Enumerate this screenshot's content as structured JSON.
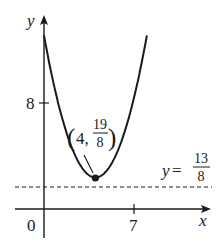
{
  "chart_data": {
    "type": "line",
    "title": "",
    "xlabel": "x",
    "ylabel": "y",
    "x_ticks": [
      {
        "value": 0,
        "label": "0"
      },
      {
        "value": 7,
        "label": "7"
      }
    ],
    "y_ticks": [
      {
        "value": 8,
        "label": "8"
      }
    ],
    "grid": false,
    "series": [
      {
        "name": "parabola",
        "kind": "quadratic",
        "vertex": [
          4,
          2.375
        ],
        "points": [
          {
            "x": 0,
            "y": 13.1
          },
          {
            "x": 1,
            "y": 8.0
          },
          {
            "x": 2,
            "y": 4.6
          },
          {
            "x": 3,
            "y": 2.8
          },
          {
            "x": 4,
            "y": 2.375
          },
          {
            "x": 5,
            "y": 2.8
          },
          {
            "x": 6,
            "y": 4.6
          },
          {
            "x": 7,
            "y": 8.0
          },
          {
            "x": 8,
            "y": 13.1
          }
        ]
      },
      {
        "name": "asymptote",
        "kind": "horizontal-dashed",
        "y": 1.625
      }
    ],
    "annotations": [
      {
        "text": "(4, 19/8)",
        "num": "19",
        "den": "8",
        "prefix": "4,",
        "at": [
          4,
          2.375
        ],
        "marker": "filled-dot"
      },
      {
        "text": "y = 13/8",
        "lhs": "y",
        "num": "13",
        "den": "8",
        "at_y": 1.625
      }
    ],
    "xlim": [
      -0.5,
      12.5
    ],
    "ylim": [
      -2.5,
      14.5
    ]
  },
  "labels": {
    "x_axis": "x",
    "y_axis": "y",
    "origin": "0",
    "x_tick_7": "7",
    "y_tick_8": "8",
    "vertex_prefix": "4,",
    "vertex_num": "19",
    "vertex_den": "8",
    "line_lhs": "y",
    "line_eq": "=",
    "line_num": "13",
    "line_den": "8"
  },
  "colors": {
    "ink": "#1a1a1a",
    "background": "#ffffff"
  }
}
